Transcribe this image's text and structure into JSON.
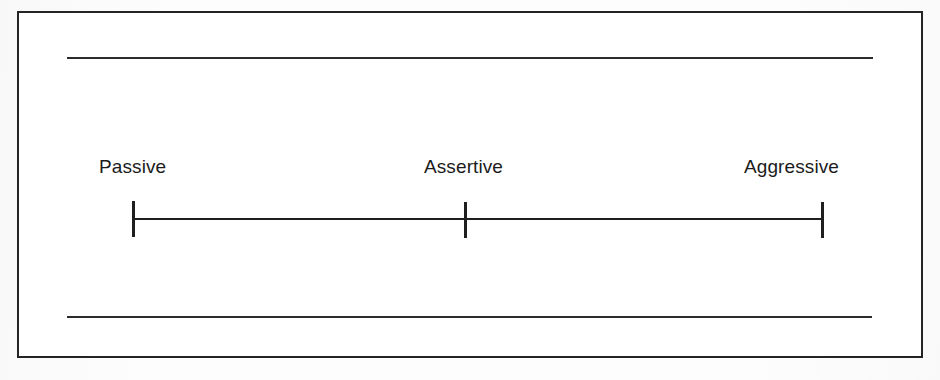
{
  "figure": {
    "type": "continuum-scale",
    "title": "",
    "frame": {
      "border_color": "#242424",
      "background_color": "#ffffff"
    },
    "rules": [
      {
        "name": "top-rule",
        "color": "#2b2b2b"
      },
      {
        "name": "bottom-rule",
        "color": "#2b2b2b"
      }
    ],
    "axis": {
      "color": "#1f1f1f",
      "tick_color": "#1f1f1f",
      "points": [
        {
          "label": "Passive",
          "position": 0
        },
        {
          "label": "Assertive",
          "position": 0.5
        },
        {
          "label": "Aggressive",
          "position": 1
        }
      ]
    },
    "labels": {
      "left": "Passive",
      "middle": "Assertive",
      "right": "Aggressive"
    }
  },
  "chart_data": {
    "type": "line",
    "title": "",
    "subtitle": "",
    "xlabel": "",
    "ylabel": "",
    "categories": [
      "Passive",
      "Assertive",
      "Aggressive"
    ],
    "x": [
      0,
      0.5,
      1
    ],
    "values": [
      0,
      0,
      0
    ],
    "tick_labels": [
      "Passive",
      "Assertive",
      "Aggressive"
    ],
    "xlim": [
      0,
      1
    ],
    "grid": false,
    "legend": null,
    "annotations": []
  }
}
